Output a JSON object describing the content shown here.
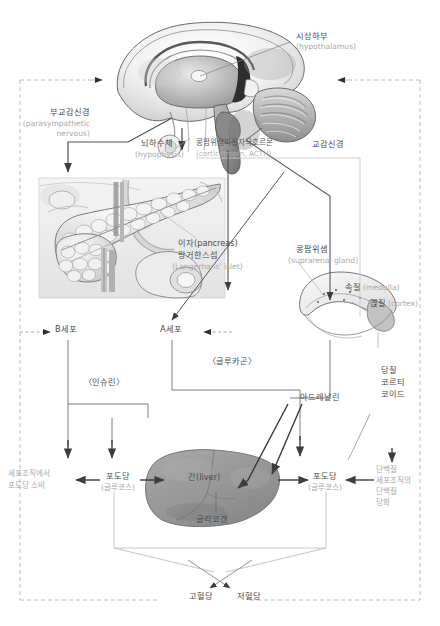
{
  "diagram": {
    "language": "ko"
  },
  "anatomy": {
    "brain": {
      "name_ko": "뇌 (시상하부 단면)",
      "callout_ko": "시상하부",
      "callout_en": "(hypothalamus)"
    },
    "pituitary": {
      "label_ko": "뇌하수체",
      "label_en": "(hypophysis)"
    },
    "pancreas": {
      "label_ko": "이자(pancreas)",
      "label_ko2": "랑거한스섬",
      "label_en": "(Langerhans' islet)"
    },
    "adrenal": {
      "label_ko": "콩팜위샘",
      "label_en": "(suprarenal gland)",
      "medulla_ko": "속질",
      "medulla_en": "(medulla)",
      "cortex_ko": "곉질",
      "cortex_en": "(cortex)"
    },
    "liver": {
      "label": "간(liver)",
      "glycogen": "글리코겐"
    }
  },
  "nerves": {
    "parasympathetic_ko": "부교감신경",
    "parasympathetic_en1": "(parasympathetic",
    "parasympathetic_en2": "nervous)",
    "sympathetic_ko": "교감신경"
  },
  "hormones": {
    "acth_ko": "콩팜위샘피질자극호르몬",
    "acth_en": "(corticotropin, ACTH)",
    "insulin": "〈인슈린〉",
    "glucagon": "〈글루카곤〉",
    "adrenaline": "아드레날린",
    "glucocorticoid_l1": "당질",
    "glucocorticoid_l2": "코르티",
    "glucocorticoid_l3": "코이드"
  },
  "cells": {
    "b_cell": "B세포",
    "a_cell": "A세포"
  },
  "metabolism": {
    "tissue_consumption_l1": "세포조직에서",
    "tissue_consumption_l2": "포도당 소비",
    "glucose_left_ko": "포도당",
    "glucose_left_en": "(글루코스)",
    "glucose_right_ko": "포도당",
    "glucose_right_en": "(글루코스)",
    "protein_l1": "단백질",
    "protein_l2": "세포조직의",
    "protein_l3": "단백질",
    "protein_l4": "당화"
  },
  "outcomes": {
    "hyperglycemia": "고혈당",
    "hypoglycemia": "저혈당"
  },
  "colors": {
    "line": "#7a7a7a",
    "dashed": "#b9b9b9",
    "text_ko": "#4a4a4a",
    "text_en": "#a9a9a9",
    "liver_fill": "#9a9a9a",
    "adrenal_cortex": "#bfbfbf"
  }
}
